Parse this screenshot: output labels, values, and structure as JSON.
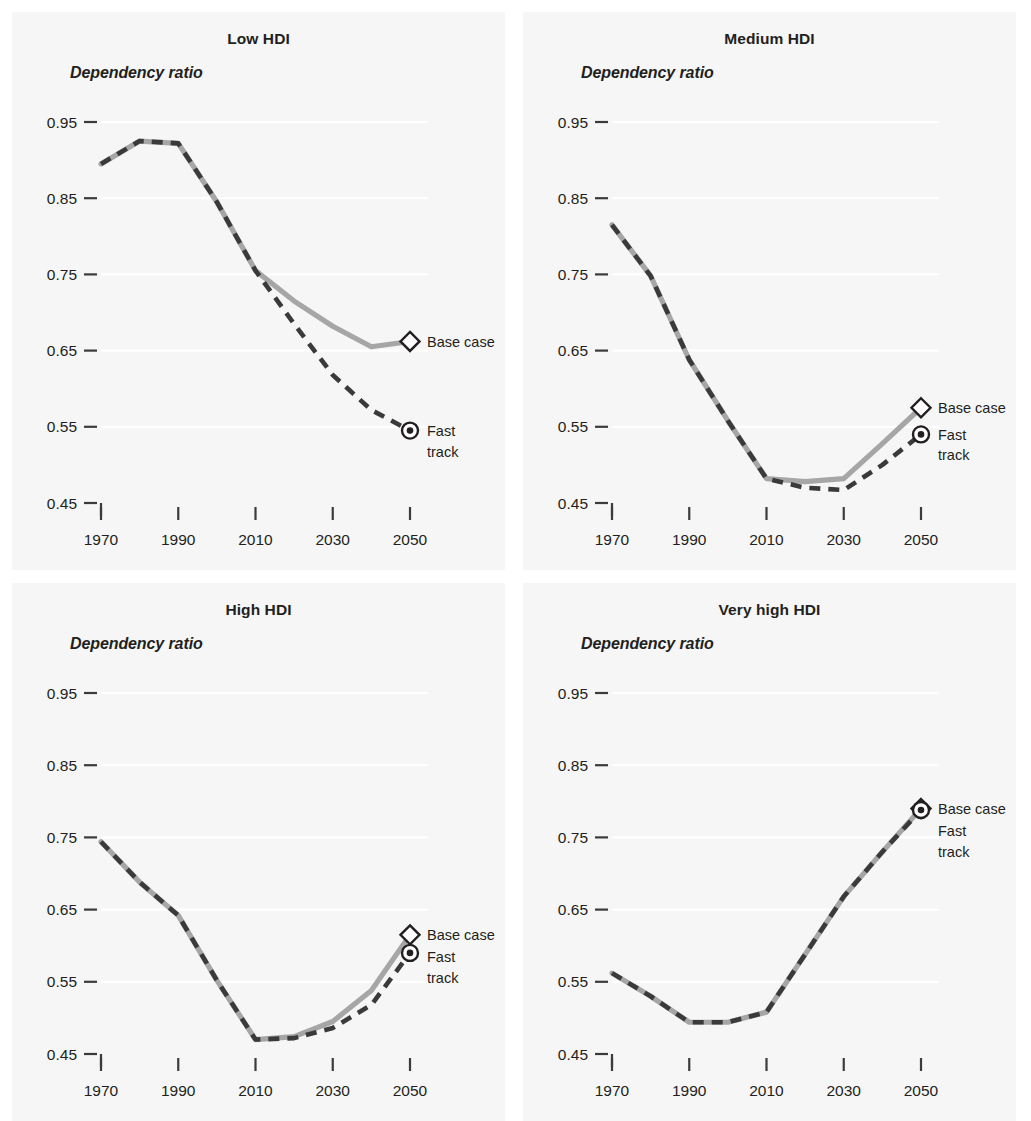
{
  "figure": {
    "background": "#ffffff",
    "panel_background": "#f6f6f6",
    "base_case_color": "#a6a6a6",
    "fast_track_color": "#3a3a3a",
    "axis_caption": "Dependency ratio",
    "legend": {
      "base_case": "Base case",
      "fast_track_line1": "Fast",
      "fast_track_line2": "track",
      "fast_track_full": "Fast track"
    }
  },
  "chart_data": [
    {
      "type": "line",
      "title": "Low HDI",
      "xlabel": "",
      "ylabel": "Dependency ratio",
      "x": [
        1970,
        1980,
        1990,
        2000,
        2010,
        2020,
        2030,
        2040,
        2050
      ],
      "xlim": [
        1970,
        2050
      ],
      "ylim": [
        0.45,
        0.95
      ],
      "xticks": [
        1970,
        1990,
        2010,
        2030,
        2050
      ],
      "xticklabels": [
        "1970",
        "1990",
        "2010",
        "2030",
        "2050"
      ],
      "yticks": [
        0.45,
        0.55,
        0.65,
        0.75,
        0.85,
        0.95
      ],
      "yticklabels": [
        "0.45",
        "0.55",
        "0.65",
        "0.75",
        "0.85",
        "0.95"
      ],
      "grid": true,
      "legend_position": "right-inline",
      "series": [
        {
          "name": "Base case",
          "style": "solid",
          "color": "#a6a6a6",
          "marker": "diamond",
          "values": [
            0.895,
            0.925,
            0.922,
            0.845,
            0.755,
            0.715,
            0.682,
            0.655,
            0.662
          ]
        },
        {
          "name": "Fast track",
          "style": "dashed",
          "color": "#3a3a3a",
          "marker": "circle-dot",
          "values": [
            0.895,
            0.925,
            0.922,
            0.845,
            0.755,
            0.685,
            0.618,
            0.572,
            0.545
          ]
        }
      ]
    },
    {
      "type": "line",
      "title": "Medium HDI",
      "xlabel": "",
      "ylabel": "Dependency ratio",
      "x": [
        1970,
        1980,
        1990,
        2000,
        2010,
        2020,
        2030,
        2040,
        2050
      ],
      "xlim": [
        1970,
        2050
      ],
      "ylim": [
        0.45,
        0.95
      ],
      "xticks": [
        1970,
        1990,
        2010,
        2030,
        2050
      ],
      "xticklabels": [
        "1970",
        "1990",
        "2010",
        "2030",
        "2050"
      ],
      "yticks": [
        0.45,
        0.55,
        0.65,
        0.75,
        0.85,
        0.95
      ],
      "yticklabels": [
        "0.45",
        "0.55",
        "0.65",
        "0.75",
        "0.85",
        "0.95"
      ],
      "grid": true,
      "legend_position": "right-inline",
      "series": [
        {
          "name": "Base case",
          "style": "solid",
          "color": "#a6a6a6",
          "marker": "diamond",
          "values": [
            0.815,
            0.748,
            0.638,
            0.558,
            0.482,
            0.478,
            0.482,
            0.528,
            0.575
          ]
        },
        {
          "name": "Fast track",
          "style": "dashed",
          "color": "#3a3a3a",
          "marker": "circle-dot",
          "values": [
            0.815,
            0.748,
            0.638,
            0.558,
            0.482,
            0.47,
            0.467,
            0.5,
            0.54
          ]
        }
      ]
    },
    {
      "type": "line",
      "title": "High HDI",
      "xlabel": "",
      "ylabel": "Dependency ratio",
      "x": [
        1970,
        1980,
        1990,
        2000,
        2010,
        2020,
        2030,
        2040,
        2050
      ],
      "xlim": [
        1970,
        2050
      ],
      "ylim": [
        0.45,
        0.95
      ],
      "xticks": [
        1970,
        1990,
        2010,
        2030,
        2050
      ],
      "xticklabels": [
        "1970",
        "1990",
        "2010",
        "2030",
        "2050"
      ],
      "yticks": [
        0.45,
        0.55,
        0.65,
        0.75,
        0.85,
        0.95
      ],
      "yticklabels": [
        "0.45",
        "0.55",
        "0.65",
        "0.75",
        "0.85",
        "0.95"
      ],
      "grid": true,
      "legend_position": "right-inline",
      "series": [
        {
          "name": "Base case",
          "style": "solid",
          "color": "#a6a6a6",
          "marker": "diamond",
          "values": [
            0.744,
            0.688,
            0.642,
            0.552,
            0.47,
            0.474,
            0.495,
            0.538,
            0.615
          ]
        },
        {
          "name": "Fast track",
          "style": "dashed",
          "color": "#3a3a3a",
          "marker": "circle-dot",
          "values": [
            0.744,
            0.688,
            0.642,
            0.552,
            0.47,
            0.472,
            0.486,
            0.518,
            0.59
          ]
        }
      ]
    },
    {
      "type": "line",
      "title": "Very high HDI",
      "xlabel": "",
      "ylabel": "Dependency ratio",
      "x": [
        1970,
        1980,
        1990,
        2000,
        2010,
        2020,
        2030,
        2040,
        2050
      ],
      "xlim": [
        1970,
        2050
      ],
      "ylim": [
        0.45,
        0.95
      ],
      "xticks": [
        1970,
        1990,
        2010,
        2030,
        2050
      ],
      "xticklabels": [
        "1970",
        "1990",
        "2010",
        "2030",
        "2050"
      ],
      "yticks": [
        0.45,
        0.55,
        0.65,
        0.75,
        0.85,
        0.95
      ],
      "yticklabels": [
        "0.45",
        "0.55",
        "0.65",
        "0.75",
        "0.85",
        "0.95"
      ],
      "grid": true,
      "legend_position": "right-inline",
      "series": [
        {
          "name": "Base case",
          "style": "solid",
          "color": "#a6a6a6",
          "marker": "diamond",
          "values": [
            0.562,
            0.53,
            0.494,
            0.494,
            0.508,
            0.588,
            0.668,
            0.73,
            0.79
          ]
        },
        {
          "name": "Fast track",
          "style": "dashed",
          "color": "#3a3a3a",
          "marker": "circle-dot",
          "values": [
            0.562,
            0.53,
            0.494,
            0.494,
            0.508,
            0.588,
            0.668,
            0.73,
            0.788
          ]
        }
      ]
    }
  ],
  "panels": [
    {
      "key": "low",
      "title": "Low HDI"
    },
    {
      "key": "medium",
      "title": "Medium HDI"
    },
    {
      "key": "high",
      "title": "High HDI"
    },
    {
      "key": "very_high",
      "title": "Very high HDI"
    }
  ]
}
